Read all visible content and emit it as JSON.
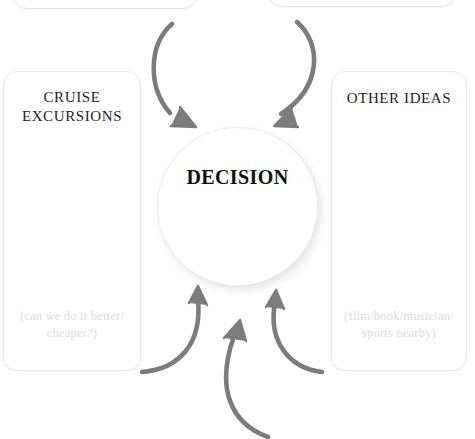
{
  "diagram": {
    "title": "DECISION",
    "center": {
      "label": "DECISION",
      "shape": "circle"
    },
    "cards": [
      {
        "id": "top-left",
        "title": "",
        "hint": "",
        "position": "top-left-cropped"
      },
      {
        "id": "top-right",
        "title": "",
        "hint": "",
        "position": "top-right-cropped"
      },
      {
        "id": "cruise-excursions",
        "title": "CRUISE\nEXCURSIONS",
        "hint": "(can we do it better/\ncheaper?)",
        "position": "left"
      },
      {
        "id": "other-ideas",
        "title": "OTHER IDEAS",
        "hint": "(film/book/musician/\nsports nearby)",
        "position": "right"
      }
    ],
    "arrows": [
      {
        "id": "arrow-top-left",
        "from": "top-left-card",
        "to": "decision",
        "direction": "down-right"
      },
      {
        "id": "arrow-top-right",
        "from": "top-right-card",
        "to": "decision",
        "direction": "down-left"
      },
      {
        "id": "arrow-bottom-left",
        "from": "cruise-excursions",
        "to": "decision",
        "direction": "up-right"
      },
      {
        "id": "arrow-bottom-mid",
        "from": "below",
        "to": "decision",
        "direction": "up"
      },
      {
        "id": "arrow-bottom-right",
        "from": "other-ideas",
        "to": "decision",
        "direction": "up-left"
      }
    ],
    "colors": {
      "arrow": "#7c7c7c",
      "card_border": "#e6e6e6",
      "title_text": "#1d1d1d",
      "hint_text": "#dcdcdc",
      "background": "#ffffff"
    }
  }
}
